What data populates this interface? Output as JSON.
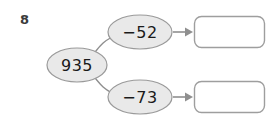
{
  "question": {
    "number": "8"
  },
  "diagram": {
    "type": "function-machine",
    "start_node": {
      "label": "935",
      "name": "start-value-node"
    },
    "branches": [
      {
        "operation_label": "−52",
        "operation_name": "subtract-52",
        "answer_value": "",
        "answer_placeholder": ""
      },
      {
        "operation_label": "−73",
        "operation_name": "subtract-73",
        "answer_value": "",
        "answer_placeholder": ""
      }
    ]
  },
  "colors": {
    "ellipse_fill": "#e9e9e9",
    "ellipse_stroke": "#9a9a9a",
    "box_fill": "#ffffff",
    "box_stroke": "#9e9e9e",
    "connector": "#8f8f8f",
    "text": "#1a1a1a",
    "question_number": "#3b3b3b",
    "background": "#ffffff"
  }
}
